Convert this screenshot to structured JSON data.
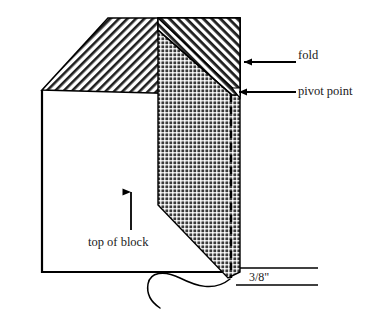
{
  "diagram": {
    "labels": {
      "fold": "fold",
      "pivot_point": "pivot point",
      "top_of_block": "top of block",
      "dimension": "3/8\""
    },
    "annotations": [
      {
        "name": "fold-arrow",
        "points_to": "fold band",
        "direction": "left"
      },
      {
        "name": "pivot-arrow",
        "points_to": "pivot point vertex",
        "direction": "left"
      },
      {
        "name": "top-of-block-arrow",
        "points_to": "top of block surface",
        "direction": "up"
      },
      {
        "name": "dimension-leader",
        "points_to": "bottom vertex",
        "style": "curved squiggle"
      }
    ],
    "regions": [
      {
        "name": "fold-flap",
        "fill": "diagonal-hatch",
        "color": "#1a1a1a"
      },
      {
        "name": "block-body",
        "fill": "cross-hatch-dark",
        "color": "#2b2b2b"
      },
      {
        "name": "fold-band",
        "fill": "diagonal-hatch-light",
        "color": "#1a1a1a"
      },
      {
        "name": "pivot-line",
        "fill": "dashed",
        "color": "#000000"
      }
    ],
    "colors": {
      "ink": "#000000",
      "hatch": "#1a1a1a",
      "dark_fill": "#2b2b2b",
      "background": "#ffffff"
    }
  }
}
